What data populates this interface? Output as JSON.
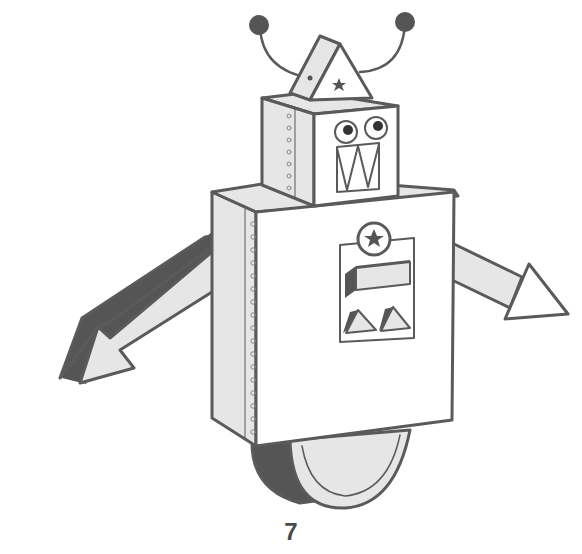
{
  "page": {
    "number": "7",
    "illustration": "robot-coloring-page"
  },
  "colors": {
    "outline": "#5a5a5a",
    "light_fill": "#e6e6e6",
    "dark_fill": "#555555",
    "white": "#ffffff"
  },
  "icons": {
    "antenna": "antenna-ball",
    "hat_star": "star",
    "chest_badge": "star-in-circle"
  }
}
